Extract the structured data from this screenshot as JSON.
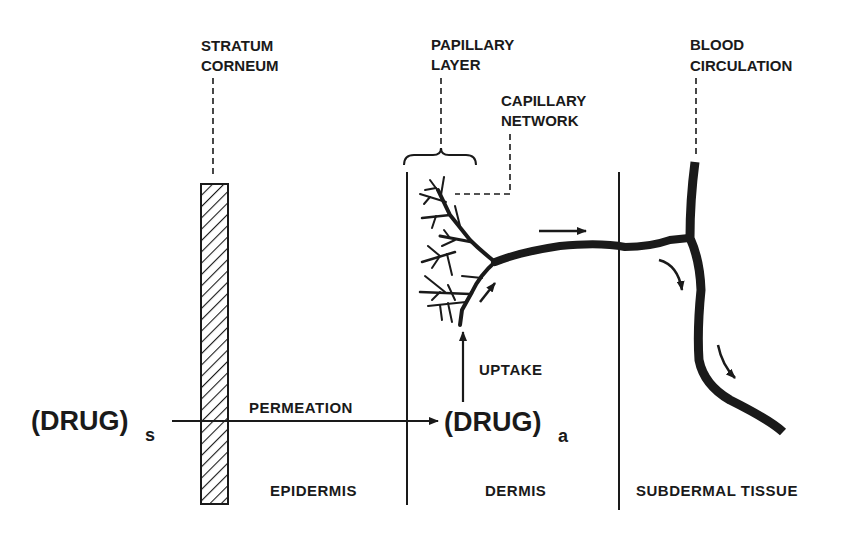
{
  "title_labels": {
    "stratum_corneum": [
      "STRATUM",
      "CORNEUM"
    ],
    "papillary_layer": [
      "PAPILLARY",
      "LAYER"
    ],
    "capillary_network": [
      "CAPILLARY",
      "NETWORK"
    ],
    "blood_circulation": [
      "BLOOD",
      "CIRCULATION"
    ]
  },
  "drug_source": {
    "text": "(DRUG)",
    "subscript": "s"
  },
  "drug_absorbed": {
    "text": "(DRUG)",
    "subscript": "a"
  },
  "process_labels": {
    "permeation": "PERMEATION",
    "uptake": "UPTAKE"
  },
  "region_labels": {
    "epidermis": "EPIDERMIS",
    "dermis": "DERMIS",
    "subdermal": "SUBDERMAL TISSUE"
  },
  "colors": {
    "ink": "#1a1a1a",
    "background": "#ffffff"
  }
}
